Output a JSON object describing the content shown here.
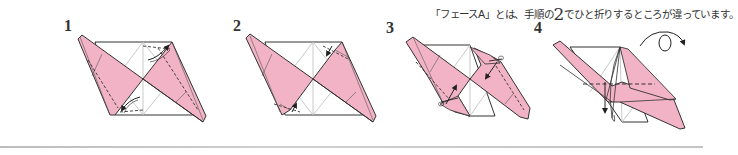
{
  "caption": {
    "before": "「フェースA」とは、手順の",
    "highlight": "2",
    "after": "でひと折りするところが違っています。"
  },
  "steps": [
    {
      "label": "1",
      "description": "Fold corners inward along dashed lines (valley folds)"
    },
    {
      "label": "2",
      "description": "Fold corners back along dashed lines"
    },
    {
      "label": "3",
      "description": "Fold flaps along dashed lines in arrow directions"
    },
    {
      "label": "4",
      "description": "Fold down along horizontal dashed line, then turn over"
    }
  ],
  "colors": {
    "paper_pink": "#f2b3c6",
    "line": "#333333",
    "crease": "#b5b5b5",
    "rule": "#c4c4c4"
  },
  "icons": {
    "turn_over": "turn-over-arrow-icon"
  }
}
